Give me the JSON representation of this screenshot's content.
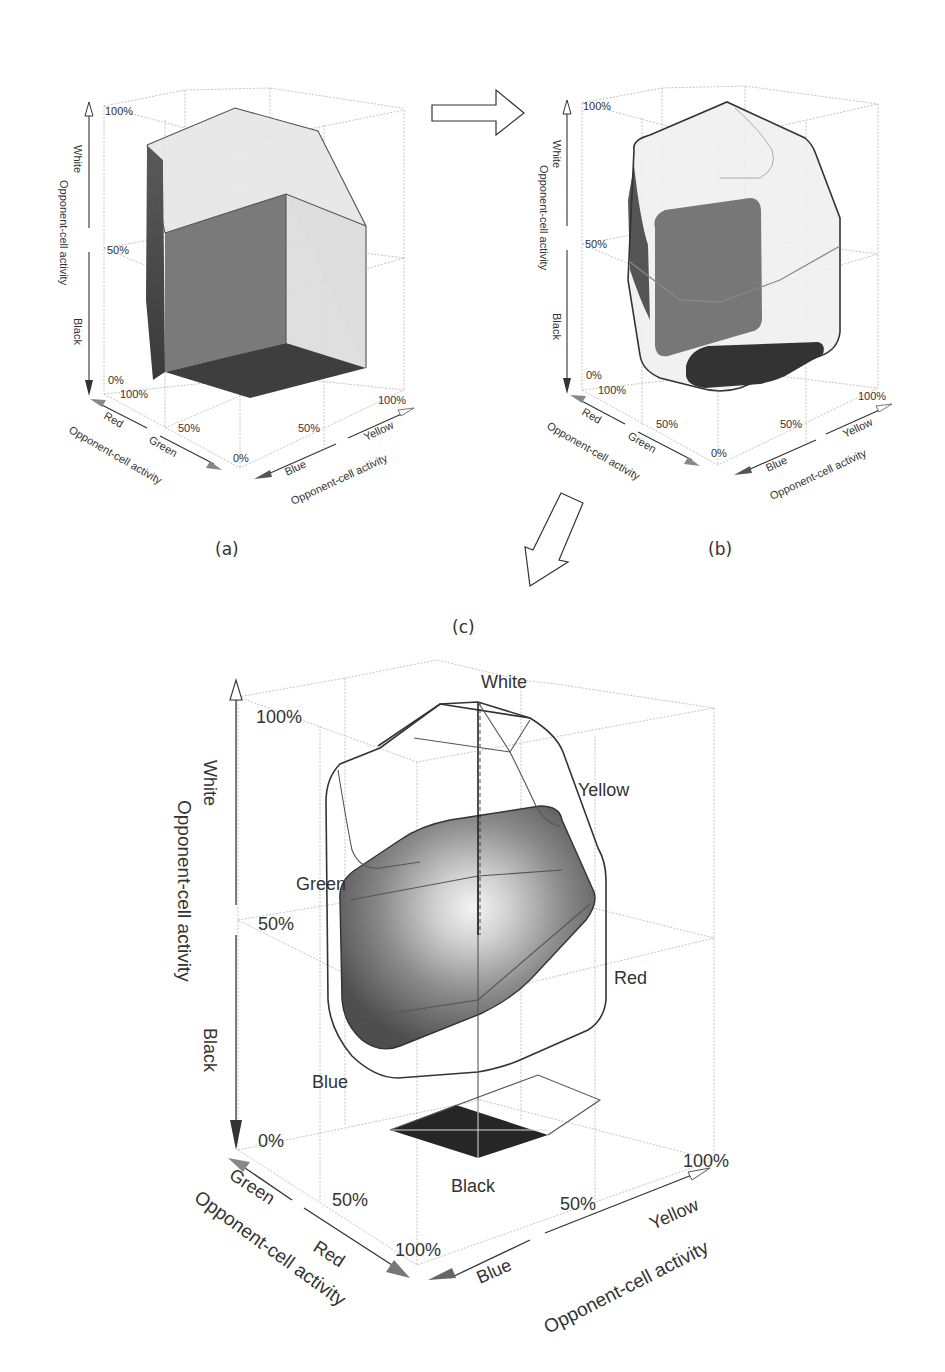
{
  "figure": {
    "panels": [
      {
        "id": "a",
        "label": "(a)",
        "vertical_axis": {
          "title": "Opponent-cell activity",
          "up": "White",
          "down": "Black",
          "ticks": [
            "100%",
            "50%",
            "0%"
          ]
        },
        "left_axis": {
          "title": "Opponent-cell activity",
          "labels": [
            "Red",
            "Green"
          ],
          "ticks": [
            "100%",
            "50%",
            "0%"
          ]
        },
        "right_axis": {
          "title": "Opponent-cell activity",
          "labels": [
            "Blue",
            "Yellow"
          ],
          "ticks": [
            "50%",
            "100%"
          ]
        }
      },
      {
        "id": "b",
        "label": "(b)",
        "vertical_axis": {
          "title": "Opponent-cell activity",
          "up": "White",
          "down": "Black",
          "ticks": [
            "100%",
            "50%",
            "0%"
          ]
        },
        "left_axis": {
          "title": "Opponent-cell activity",
          "labels": [
            "Red",
            "Green"
          ],
          "ticks": [
            "100%",
            "50%",
            "0%"
          ]
        },
        "right_axis": {
          "title": "Opponent-cell activity",
          "labels": [
            "Blue",
            "Yellow"
          ],
          "ticks": [
            "50%",
            "100%"
          ]
        }
      },
      {
        "id": "c",
        "label": "(c)",
        "vertical_axis": {
          "title": "Opponent-cell activity",
          "up": "White",
          "down": "Black",
          "ticks": [
            "100%",
            "50%",
            "0%"
          ]
        },
        "left_axis": {
          "title": "Opponent-cell activity",
          "labels": [
            "Green",
            "Red"
          ],
          "ticks": [
            "50%",
            "100%"
          ]
        },
        "right_axis": {
          "title": "Opponent-cell activity",
          "labels": [
            "Blue",
            "Yellow"
          ],
          "ticks": [
            "50%",
            "100%"
          ]
        },
        "color_labels": {
          "white": "White",
          "yellow": "Yellow",
          "green": "Green",
          "red": "Red",
          "blue": "Blue",
          "black": "Black"
        }
      }
    ],
    "flow_arrows": [
      "a-to-b",
      "b-to-c"
    ]
  }
}
